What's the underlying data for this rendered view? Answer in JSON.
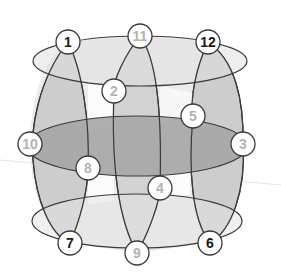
{
  "diagram": {
    "type": "barrel-lattice",
    "colors": {
      "background": "#ffffff",
      "stroke": "#3a3a3a",
      "fill_light": "#e6e6e6",
      "fill_mid": "#c9c9c9",
      "fill_dark": "#a9a9a9",
      "node_fill": "#ffffff",
      "label_dark": "#1a1a1a",
      "label_light": "#b3b3b3"
    },
    "nodes": [
      {
        "id": "1",
        "label": "1",
        "x": 68,
        "y": 42,
        "style": "dark"
      },
      {
        "id": "11",
        "label": "11",
        "x": 140,
        "y": 36,
        "style": "light"
      },
      {
        "id": "12",
        "label": "12",
        "x": 208,
        "y": 42,
        "style": "dark"
      },
      {
        "id": "2",
        "label": "2",
        "x": 114,
        "y": 91,
        "style": "light"
      },
      {
        "id": "5",
        "label": "5",
        "x": 193,
        "y": 116,
        "style": "light"
      },
      {
        "id": "10",
        "label": "10",
        "x": 30,
        "y": 144,
        "style": "light"
      },
      {
        "id": "3",
        "label": "3",
        "x": 243,
        "y": 144,
        "style": "light"
      },
      {
        "id": "8",
        "label": "8",
        "x": 88,
        "y": 168,
        "style": "light"
      },
      {
        "id": "4",
        "label": "4",
        "x": 160,
        "y": 188,
        "style": "light"
      },
      {
        "id": "7",
        "label": "7",
        "x": 70,
        "y": 243,
        "style": "dark"
      },
      {
        "id": "9",
        "label": "9",
        "x": 137,
        "y": 253,
        "style": "light"
      },
      {
        "id": "6",
        "label": "6",
        "x": 210,
        "y": 243,
        "style": "dark"
      }
    ]
  }
}
